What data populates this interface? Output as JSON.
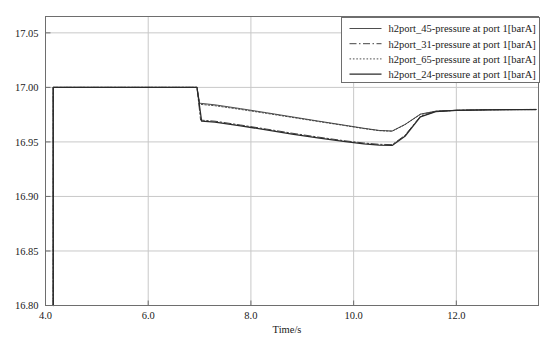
{
  "chart_data": {
    "type": "line",
    "title": "",
    "xlabel": "Time/s",
    "ylabel": "",
    "xlim": [
      4.0,
      13.6
    ],
    "ylim": [
      16.8,
      17.065
    ],
    "grid": true,
    "legend_position": "top-right",
    "xticks": [
      4.0,
      6.0,
      8.0,
      10.0,
      12.0
    ],
    "xtick_labels": [
      "4.0",
      "6.0",
      "8.0",
      "10.0",
      "12.0"
    ],
    "yticks": [
      16.8,
      16.85,
      16.9,
      16.95,
      17.0,
      17.05
    ],
    "ytick_labels": [
      "16.80",
      "16.85",
      "16.90",
      "16.95",
      "17.00",
      "17.05"
    ],
    "series": [
      {
        "name": "h2port_45-pressure at port 1[barA]",
        "style": "solid-thin",
        "color": "#3a3a3a",
        "points": [
          [
            4.15,
            16.8
          ],
          [
            4.15,
            17.0
          ],
          [
            6.95,
            17.0
          ],
          [
            7.0,
            16.9855
          ],
          [
            7.3,
            16.984
          ],
          [
            7.8,
            16.9805
          ],
          [
            8.3,
            16.9768
          ],
          [
            8.8,
            16.973
          ],
          [
            9.3,
            16.9692
          ],
          [
            9.8,
            16.9655
          ],
          [
            10.2,
            16.9625
          ],
          [
            10.5,
            16.9605
          ],
          [
            10.75,
            16.96
          ],
          [
            11.0,
            16.966
          ],
          [
            11.3,
            16.9755
          ],
          [
            11.6,
            16.9782
          ],
          [
            12.0,
            16.979
          ],
          [
            12.6,
            16.9795
          ],
          [
            13.55,
            16.9798
          ]
        ]
      },
      {
        "name": "h2port_31-pressure at port 1[barA]",
        "style": "dash-dot",
        "color": "#3a3a3a",
        "points": [
          [
            4.15,
            16.8
          ],
          [
            4.15,
            17.0
          ],
          [
            6.95,
            17.0
          ],
          [
            7.02,
            16.97
          ],
          [
            7.3,
            16.969
          ],
          [
            7.8,
            16.9655
          ],
          [
            8.3,
            16.9618
          ],
          [
            8.8,
            16.958
          ],
          [
            9.3,
            16.9545
          ],
          [
            9.8,
            16.9512
          ],
          [
            10.2,
            16.949
          ],
          [
            10.5,
            16.9478
          ],
          [
            10.75,
            16.9475
          ],
          [
            11.0,
            16.956
          ],
          [
            11.3,
            16.9735
          ],
          [
            11.6,
            16.978
          ],
          [
            12.0,
            16.979
          ],
          [
            12.6,
            16.9795
          ],
          [
            13.55,
            16.9798
          ]
        ]
      },
      {
        "name": "h2port_65-pressure at port 1[barA]",
        "style": "dotted",
        "color": "#3a3a3a",
        "points": [
          [
            4.15,
            16.8
          ],
          [
            4.15,
            17.0
          ],
          [
            6.95,
            17.0
          ],
          [
            7.0,
            16.9845
          ],
          [
            7.3,
            16.9832
          ],
          [
            7.8,
            16.9798
          ],
          [
            8.3,
            16.9762
          ],
          [
            8.8,
            16.9725
          ],
          [
            9.3,
            16.9688
          ],
          [
            9.8,
            16.9652
          ],
          [
            10.2,
            16.9622
          ],
          [
            10.5,
            16.9603
          ],
          [
            10.75,
            16.9598
          ],
          [
            11.0,
            16.9658
          ],
          [
            11.3,
            16.9752
          ],
          [
            11.6,
            16.978
          ],
          [
            12.0,
            16.9789
          ],
          [
            12.6,
            16.9794
          ],
          [
            13.55,
            16.9797
          ]
        ]
      },
      {
        "name": "h2port_24-pressure at port 1[barA]",
        "style": "solid-thick",
        "color": "#2a2a2a",
        "points": [
          [
            4.15,
            16.8
          ],
          [
            4.15,
            17.0
          ],
          [
            6.95,
            17.0
          ],
          [
            7.04,
            16.969
          ],
          [
            7.3,
            16.9682
          ],
          [
            7.8,
            16.9648
          ],
          [
            8.3,
            16.961
          ],
          [
            8.8,
            16.9572
          ],
          [
            9.3,
            16.9538
          ],
          [
            9.8,
            16.9505
          ],
          [
            10.2,
            16.9482
          ],
          [
            10.5,
            16.947
          ],
          [
            10.75,
            16.9468
          ],
          [
            11.0,
            16.9552
          ],
          [
            11.3,
            16.973
          ],
          [
            11.6,
            16.9778
          ],
          [
            12.0,
            16.9789
          ],
          [
            12.6,
            16.9794
          ],
          [
            13.55,
            16.9797
          ]
        ]
      }
    ]
  },
  "legend": {
    "entries": [
      "h2port_45-pressure at port 1[barA]",
      "h2port_31-pressure at port 1[barA]",
      "h2port_65-pressure at port 1[barA]",
      "h2port_24-pressure at port 1[barA]"
    ]
  },
  "colors": {
    "plot_border": "#6e6e6e",
    "grid": "#c8c8c8",
    "background": "#ffffff",
    "text": "#1a1a1a",
    "legend_border": "#6e6e6e"
  }
}
